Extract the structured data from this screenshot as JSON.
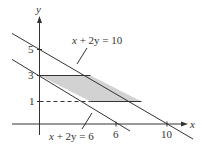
{
  "diagram": {
    "type": "linear-inequality-region",
    "axes": {
      "x_label": "x",
      "y_label": "y",
      "x_ticks": [
        {
          "value": 6,
          "label": "6"
        },
        {
          "value": 10,
          "label": "10"
        }
      ],
      "y_ticks": [
        {
          "value": 1,
          "label": "1"
        },
        {
          "value": 3,
          "label": "3"
        },
        {
          "value": 5,
          "label": "5"
        }
      ]
    },
    "lines": [
      {
        "equation": "x + 2y = 10",
        "label_x": "x",
        "label_rest": " + 2y = 10"
      },
      {
        "equation": "x + 2y = 6",
        "label_x": "x",
        "label_rest": " + 2y = 6"
      }
    ],
    "dashed_line": {
      "y": 1
    },
    "shaded_region": {
      "vertices": [
        [
          0,
          3
        ],
        [
          4,
          3
        ],
        [
          8,
          1
        ],
        [
          4,
          1
        ]
      ],
      "fill": "#d2d2d2"
    },
    "colors": {
      "line": "#333333",
      "text": "#333333",
      "region": "#d2d2d2"
    }
  }
}
